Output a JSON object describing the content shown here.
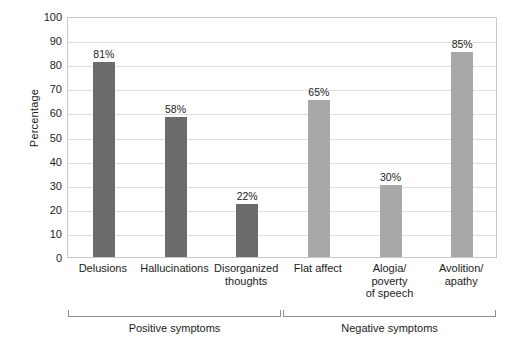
{
  "chart_data": {
    "type": "bar",
    "title": "",
    "xlabel": "",
    "ylabel": "Percentage",
    "ylim": [
      0,
      100
    ],
    "ytick_step": 10,
    "yticks": [
      100,
      90,
      80,
      70,
      60,
      50,
      40,
      30,
      20,
      10,
      0
    ],
    "grid": true,
    "legend": "none",
    "value_suffix": "%",
    "categories": [
      "Delusions",
      "Disorganized thoughts",
      "Hallucinations",
      "Flat affect",
      "Alogia/ poverty of speech",
      "Avolition/ apathy"
    ],
    "bars": [
      {
        "label_lines": [
          "Delusions"
        ],
        "value": 81,
        "value_label": "81%",
        "group": "Positive symptoms",
        "color": "#6b6b6b"
      },
      {
        "label_lines": [
          "Hallucinations"
        ],
        "value": 58,
        "value_label": "58%",
        "group": "Positive symptoms",
        "color": "#6b6b6b"
      },
      {
        "label_lines": [
          "Disorganized",
          "thoughts"
        ],
        "value": 22,
        "value_label": "22%",
        "group": "Positive symptoms",
        "color": "#6b6b6b"
      },
      {
        "label_lines": [
          "Flat affect"
        ],
        "value": 65,
        "value_label": "65%",
        "group": "Negative symptoms",
        "color": "#a8a8a8"
      },
      {
        "label_lines": [
          "Alogia/",
          "poverty",
          "of speech"
        ],
        "value": 30,
        "value_label": "30%",
        "group": "Negative symptoms",
        "color": "#a8a8a8"
      },
      {
        "label_lines": [
          "Avolition/",
          "apathy"
        ],
        "value": 85,
        "value_label": "85%",
        "group": "Negative symptoms",
        "color": "#a8a8a8"
      }
    ],
    "groups": [
      {
        "label": "Positive symptoms",
        "bar_indices": [
          0,
          1,
          2
        ]
      },
      {
        "label": "Negative symptoms",
        "bar_indices": [
          3,
          4,
          5
        ]
      }
    ],
    "colors": {
      "positive_bar": "#6b6b6b",
      "negative_bar": "#a8a8a8",
      "gridline": "#dedede",
      "plot_border": "#c9c9c9",
      "bracket": "#8e8e8e",
      "background": "#ffffff",
      "text": "#1c1c1c"
    }
  }
}
